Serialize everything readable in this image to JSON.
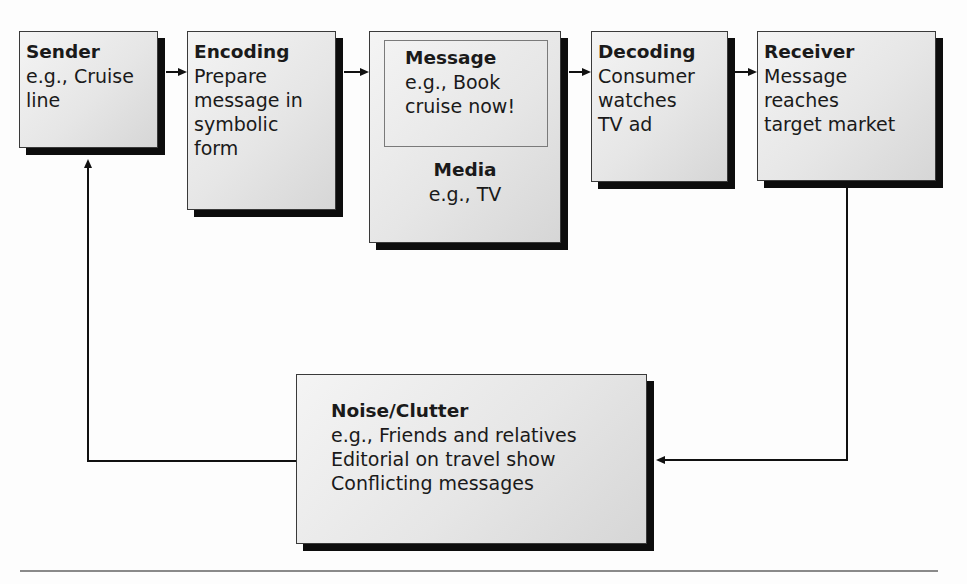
{
  "diagram": {
    "type": "communication-process-flow",
    "boxes": {
      "sender": {
        "title": "Sender",
        "lines": [
          "e.g., Cruise",
          "line"
        ]
      },
      "encoding": {
        "title": "Encoding",
        "lines": [
          "Prepare",
          "message in",
          "symbolic",
          "form"
        ]
      },
      "message": {
        "title": "Message",
        "lines": [
          "e.g., Book",
          "cruise now!"
        ]
      },
      "media": {
        "title": "Media",
        "lines": [
          "e.g., TV"
        ]
      },
      "decoding": {
        "title": "Decoding",
        "lines": [
          "Consumer",
          "watches",
          "TV ad"
        ]
      },
      "receiver": {
        "title": "Receiver",
        "lines": [
          "Message",
          "reaches",
          "target market"
        ]
      },
      "noise": {
        "title": "Noise/Clutter",
        "lines": [
          "e.g., Friends and relatives",
          "Editorial on travel show",
          "Conflicting messages"
        ]
      }
    },
    "flows": [
      {
        "from": "sender",
        "to": "encoding"
      },
      {
        "from": "encoding",
        "to": "message-media"
      },
      {
        "from": "message-media",
        "to": "decoding"
      },
      {
        "from": "decoding",
        "to": "receiver"
      },
      {
        "from": "receiver",
        "to": "noise"
      },
      {
        "from": "noise",
        "to": "sender"
      }
    ],
    "colors": {
      "box_fill": "#e6e6e6",
      "shadow": "#0d0d0d",
      "line": "#111111",
      "rule": "#8a8a8a"
    }
  }
}
